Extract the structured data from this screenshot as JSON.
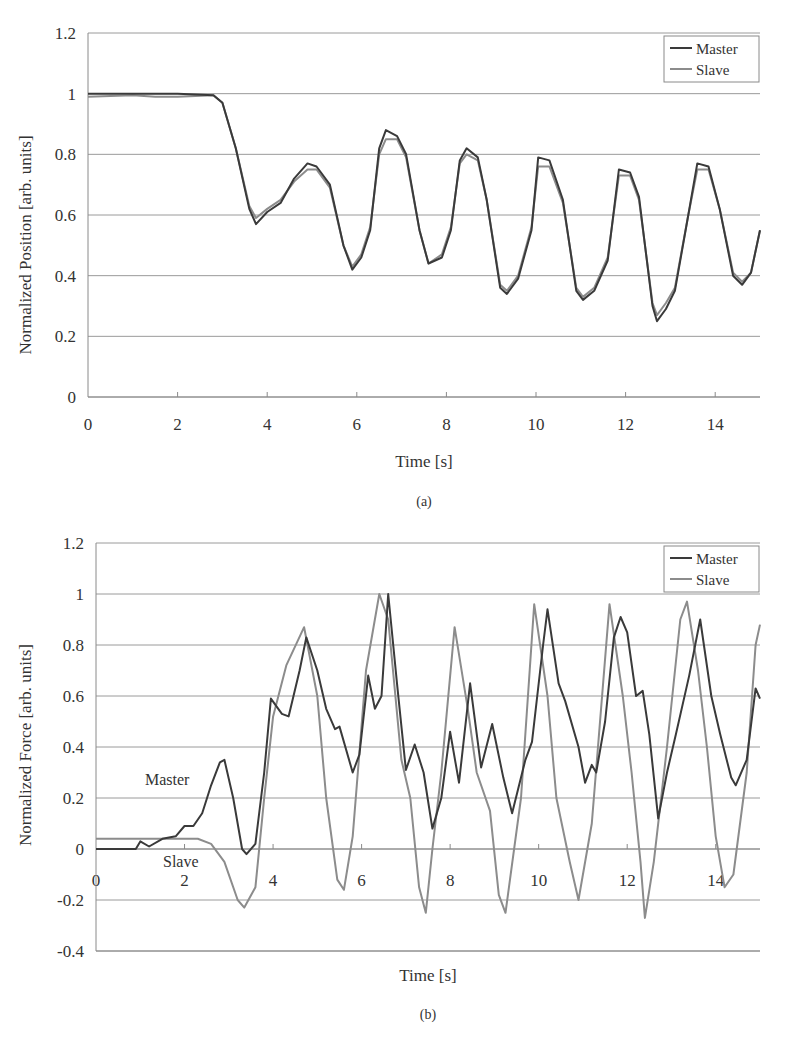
{
  "chart_data": [
    {
      "panel": "(a)",
      "type": "line",
      "title": "",
      "xlabel": "Time [s]",
      "ylabel": "Normalized Position [arb. units]",
      "xlim": [
        0,
        15
      ],
      "ylim": [
        0,
        1.2
      ],
      "xticks": [
        "0",
        "2",
        "4",
        "6",
        "8",
        "10",
        "12",
        "14"
      ],
      "yticks": [
        "0",
        "0.2",
        "0.4",
        "0.6",
        "0.8",
        "1",
        "1.2"
      ],
      "grid": true,
      "legend": {
        "position": "top-right",
        "entries": [
          "Master",
          "Slave"
        ]
      },
      "series": [
        {
          "name": "Master",
          "color": "#3a3a3a",
          "x": [
            0,
            1,
            2,
            2.8,
            3.0,
            3.3,
            3.6,
            3.75,
            4.0,
            4.3,
            4.6,
            4.9,
            5.1,
            5.4,
            5.7,
            5.9,
            6.1,
            6.3,
            6.5,
            6.65,
            6.9,
            7.1,
            7.4,
            7.6,
            7.9,
            8.1,
            8.3,
            8.45,
            8.7,
            8.9,
            9.2,
            9.35,
            9.6,
            9.9,
            10.05,
            10.3,
            10.6,
            10.9,
            11.05,
            11.3,
            11.6,
            11.85,
            12.1,
            12.3,
            12.6,
            12.7,
            12.9,
            13.1,
            13.4,
            13.6,
            13.85,
            14.1,
            14.4,
            14.6,
            14.8,
            15.0
          ],
          "values": [
            1.0,
            1.0,
            1.0,
            0.995,
            0.97,
            0.82,
            0.62,
            0.57,
            0.61,
            0.64,
            0.72,
            0.77,
            0.76,
            0.7,
            0.5,
            0.42,
            0.46,
            0.55,
            0.82,
            0.88,
            0.86,
            0.8,
            0.55,
            0.44,
            0.46,
            0.55,
            0.78,
            0.82,
            0.79,
            0.65,
            0.36,
            0.34,
            0.39,
            0.55,
            0.79,
            0.78,
            0.65,
            0.35,
            0.32,
            0.35,
            0.45,
            0.75,
            0.74,
            0.66,
            0.3,
            0.25,
            0.29,
            0.35,
            0.6,
            0.77,
            0.76,
            0.62,
            0.4,
            0.37,
            0.41,
            0.55
          ]
        },
        {
          "name": "Slave",
          "color": "#8c8c8c",
          "x": [
            0,
            1,
            1.5,
            2,
            2.8,
            3.0,
            3.3,
            3.6,
            3.75,
            4.0,
            4.3,
            4.6,
            4.9,
            5.1,
            5.4,
            5.7,
            5.9,
            6.1,
            6.3,
            6.5,
            6.65,
            6.9,
            7.1,
            7.4,
            7.6,
            7.9,
            8.1,
            8.3,
            8.45,
            8.7,
            8.9,
            9.2,
            9.35,
            9.6,
            9.9,
            10.05,
            10.3,
            10.6,
            10.9,
            11.05,
            11.3,
            11.6,
            11.85,
            12.1,
            12.3,
            12.6,
            12.7,
            12.9,
            13.1,
            13.4,
            13.6,
            13.85,
            14.1,
            14.4,
            14.6,
            14.8,
            15.0
          ],
          "values": [
            0.99,
            0.995,
            0.99,
            0.99,
            0.995,
            0.97,
            0.82,
            0.63,
            0.59,
            0.62,
            0.65,
            0.71,
            0.75,
            0.75,
            0.69,
            0.5,
            0.43,
            0.47,
            0.56,
            0.8,
            0.85,
            0.85,
            0.79,
            0.55,
            0.44,
            0.47,
            0.56,
            0.77,
            0.8,
            0.78,
            0.65,
            0.37,
            0.35,
            0.4,
            0.56,
            0.76,
            0.76,
            0.64,
            0.36,
            0.33,
            0.36,
            0.46,
            0.73,
            0.73,
            0.65,
            0.31,
            0.27,
            0.31,
            0.36,
            0.6,
            0.75,
            0.75,
            0.62,
            0.41,
            0.38,
            0.41,
            0.55
          ]
        }
      ],
      "caption": "(a)"
    },
    {
      "panel": "(b)",
      "type": "line",
      "title": "",
      "xlabel": "Time [s]",
      "ylabel": "Normalized Force [arb. units]",
      "xlim": [
        0,
        15
      ],
      "ylim": [
        -0.4,
        1.2
      ],
      "xticks": [
        "0",
        "2",
        "4",
        "6",
        "8",
        "10",
        "12",
        "14"
      ],
      "yticks": [
        "-0.4",
        "-0.2",
        "0",
        "0.2",
        "0.4",
        "0.6",
        "0.8",
        "1",
        "1.2"
      ],
      "grid": true,
      "legend": {
        "position": "top-right",
        "entries": [
          "Master",
          "Slave"
        ]
      },
      "annotations": [
        {
          "text": "Master",
          "x": 1.1,
          "y": 0.3
        },
        {
          "text": "Slave",
          "x": 1.5,
          "y": -0.05
        }
      ],
      "series": [
        {
          "name": "Master",
          "color": "#3a3a3a",
          "x": [
            0,
            0.9,
            1.0,
            1.2,
            1.5,
            1.8,
            2.0,
            2.2,
            2.4,
            2.6,
            2.8,
            2.9,
            3.1,
            3.3,
            3.4,
            3.6,
            3.8,
            3.95,
            4.2,
            4.35,
            4.6,
            4.75,
            5.0,
            5.2,
            5.4,
            5.5,
            5.8,
            5.95,
            6.15,
            6.3,
            6.45,
            6.6,
            6.8,
            7.0,
            7.2,
            7.4,
            7.6,
            7.8,
            8.0,
            8.2,
            8.45,
            8.7,
            8.95,
            9.2,
            9.4,
            9.7,
            9.85,
            10.1,
            10.2,
            10.45,
            10.6,
            10.9,
            11.05,
            11.2,
            11.3,
            11.5,
            11.7,
            11.85,
            12.0,
            12.2,
            12.35,
            12.5,
            12.7,
            12.9,
            13.1,
            13.4,
            13.65,
            13.9,
            14.1,
            14.35,
            14.45,
            14.7,
            14.9,
            15.0
          ],
          "values": [
            0,
            0,
            0.03,
            0.01,
            0.04,
            0.05,
            0.09,
            0.09,
            0.14,
            0.25,
            0.34,
            0.35,
            0.2,
            0.0,
            -0.02,
            0.02,
            0.3,
            0.59,
            0.53,
            0.52,
            0.7,
            0.83,
            0.7,
            0.55,
            0.47,
            0.48,
            0.3,
            0.37,
            0.68,
            0.55,
            0.6,
            1.0,
            0.65,
            0.31,
            0.41,
            0.3,
            0.08,
            0.2,
            0.46,
            0.26,
            0.65,
            0.32,
            0.49,
            0.28,
            0.14,
            0.35,
            0.42,
            0.8,
            0.94,
            0.65,
            0.58,
            0.4,
            0.26,
            0.33,
            0.3,
            0.5,
            0.83,
            0.91,
            0.85,
            0.6,
            0.62,
            0.45,
            0.12,
            0.3,
            0.45,
            0.68,
            0.9,
            0.6,
            0.45,
            0.28,
            0.25,
            0.35,
            0.63,
            0.59
          ]
        },
        {
          "name": "Slave",
          "color": "#8c8c8c",
          "x": [
            0,
            1.8,
            2.3,
            2.6,
            2.9,
            3.2,
            3.35,
            3.6,
            3.8,
            4.0,
            4.3,
            4.7,
            5.0,
            5.2,
            5.45,
            5.6,
            5.8,
            6.1,
            6.4,
            6.6,
            6.9,
            7.1,
            7.3,
            7.45,
            7.6,
            7.8,
            8.1,
            8.4,
            8.6,
            8.9,
            9.1,
            9.25,
            9.6,
            9.9,
            10.2,
            10.4,
            10.7,
            10.9,
            11.2,
            11.6,
            11.9,
            12.1,
            12.3,
            12.4,
            12.6,
            12.9,
            13.2,
            13.35,
            13.6,
            13.8,
            14.0,
            14.2,
            14.4,
            14.7,
            14.9,
            15.0
          ],
          "values": [
            0.04,
            0.04,
            0.04,
            0.02,
            -0.05,
            -0.2,
            -0.23,
            -0.15,
            0.2,
            0.52,
            0.72,
            0.87,
            0.6,
            0.2,
            -0.12,
            -0.16,
            0.05,
            0.7,
            1.0,
            0.9,
            0.35,
            0.2,
            -0.15,
            -0.25,
            0.0,
            0.3,
            0.87,
            0.55,
            0.3,
            0.15,
            -0.18,
            -0.25,
            0.2,
            0.96,
            0.6,
            0.2,
            -0.05,
            -0.2,
            0.1,
            0.96,
            0.6,
            0.3,
            -0.05,
            -0.27,
            -0.05,
            0.4,
            0.9,
            0.97,
            0.7,
            0.4,
            0.05,
            -0.15,
            -0.1,
            0.3,
            0.8,
            0.88
          ]
        }
      ],
      "caption": "(b)"
    }
  ],
  "panels": {
    "a": {
      "ylabel": "Normalized Position [arb. units]",
      "xlabel": "Time [s]",
      "caption": "(a)",
      "legend": {
        "master": "Master",
        "slave": "Slave"
      }
    },
    "b": {
      "ylabel": "Normalized Force [arb. units]",
      "xlabel": "Time [s]",
      "caption": "(b)",
      "legend": {
        "master": "Master",
        "slave": "Slave"
      },
      "annotation_master": "Master",
      "annotation_slave": "Slave"
    }
  },
  "colors": {
    "master": "#3a3a3a",
    "slave": "#8c8c8c",
    "grid": "#9a9a9a"
  }
}
